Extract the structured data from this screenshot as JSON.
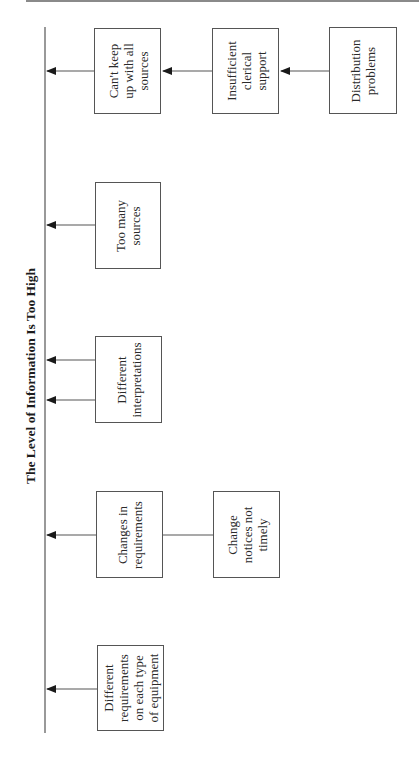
{
  "diagram": {
    "title": "The Level of Information Is Too High",
    "type": "cause-and-effect (fishbone) diagram, rotated 90 degrees",
    "colors": {
      "line": "#555555",
      "text": "#222222",
      "top_rule": "#8a8a8a"
    },
    "causes": [
      {
        "id": "cant-keep-up",
        "label": "Can't keep\nup with all\nsources",
        "feeds_into": "spine",
        "sub_causes": [
          {
            "id": "insufficient-clerical",
            "label": "Insufficient\nclerical\nsupport",
            "feeds_into": "cant-keep-up",
            "sub_causes": [
              {
                "id": "distribution-problems",
                "label": "Distribution\nproblems",
                "feeds_into": "insufficient-clerical"
              }
            ]
          }
        ]
      },
      {
        "id": "too-many-sources",
        "label": "Too many\nsources",
        "feeds_into": "spine"
      },
      {
        "id": "different-interpretations",
        "label": "Different\ninterpretations",
        "feeds_into": "spine",
        "arrow_count": 2
      },
      {
        "id": "changes-in-requirements",
        "label": "Changes in\nrequirements",
        "feeds_into": "spine",
        "sub_causes": [
          {
            "id": "change-notices",
            "label": "Change\nnotices not\ntimely",
            "connection": "line (no arrow)"
          }
        ]
      },
      {
        "id": "different-requirements",
        "label": "Different\nrequirements\non each type\nof equipment",
        "feeds_into": "spine"
      }
    ]
  }
}
